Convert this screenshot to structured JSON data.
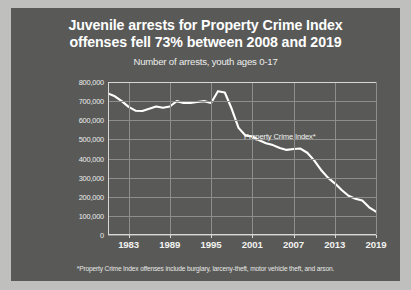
{
  "title_lines": [
    "Juvenile arrests for Property Crime Index",
    "offenses fell 73% between 2008 and 2019"
  ],
  "subtitle": "Number of arrests, youth ages 0-17",
  "footnote": "*Property Crime Index offenses include burglary, larceny-theft, motor vehicle theft, and arson.",
  "series_label": "Property Crime Index*",
  "colors": {
    "panel": "#595a58",
    "page": "#bfbfbd",
    "line": "#ffffff",
    "grid": "#8d8e8b",
    "axis": "#d8d8d6",
    "text": "#ffffff"
  },
  "chart_data": {
    "type": "line",
    "title": "Juvenile arrests for Property Crime Index offenses fell 73% between 2008 and 2019",
    "subtitle": "Number of arrests, youth ages 0-17",
    "xlabel": "",
    "ylabel": "",
    "xlim": [
      1980,
      2019
    ],
    "ylim": [
      0,
      800000
    ],
    "grid": true,
    "legend": "none",
    "ytick_labels": [
      "800,000",
      "700,000",
      "600,000",
      "500,000",
      "400,000",
      "300,000",
      "200,000",
      "100,000",
      "0"
    ],
    "ytick_values": [
      800000,
      700000,
      600000,
      500000,
      400000,
      300000,
      200000,
      100000,
      0
    ],
    "xtick_labels": [
      "1983",
      "1989",
      "1995",
      "2001",
      "2007",
      "2013",
      "2019"
    ],
    "xtick_values": [
      1983,
      1989,
      1995,
      2001,
      2007,
      2013,
      2019
    ],
    "annotations": [
      {
        "text": "Property Crime Index*",
        "x": 2005,
        "y": 520000
      }
    ],
    "series": [
      {
        "name": "Property Crime Index*",
        "x": [
          1980,
          1981,
          1982,
          1983,
          1984,
          1985,
          1986,
          1987,
          1988,
          1989,
          1990,
          1991,
          1992,
          1993,
          1994,
          1995,
          1996,
          1997,
          1998,
          1999,
          2000,
          2001,
          2002,
          2003,
          2004,
          2005,
          2006,
          2007,
          2008,
          2009,
          2010,
          2011,
          2012,
          2013,
          2014,
          2015,
          2016,
          2017,
          2018,
          2019
        ],
        "values": [
          740000,
          725000,
          700000,
          670000,
          650000,
          648000,
          660000,
          672000,
          665000,
          672000,
          700000,
          690000,
          690000,
          695000,
          700000,
          690000,
          752000,
          745000,
          660000,
          560000,
          520000,
          515000,
          495000,
          480000,
          470000,
          455000,
          445000,
          450000,
          452000,
          430000,
          390000,
          340000,
          300000,
          270000,
          235000,
          205000,
          190000,
          180000,
          145000,
          122000
        ]
      }
    ]
  }
}
